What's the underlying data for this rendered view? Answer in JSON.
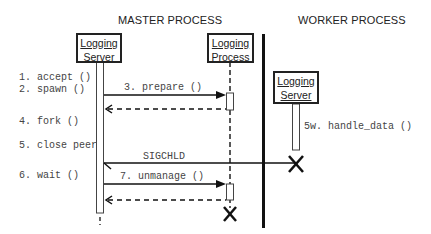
{
  "headers": {
    "master": "MASTER PROCESS",
    "worker": "WORKER PROCESS"
  },
  "objects": {
    "master_server": {
      "line1": "Logging",
      "line2": "Server"
    },
    "master_process": {
      "line1": "Logging",
      "line2": "Process"
    },
    "worker_server": {
      "line1": "Logging",
      "line2": "Server"
    }
  },
  "steps": [
    "1. accept ()",
    "2. spawn ()",
    "4. fork ()",
    "5. close peer",
    "6. wait ()"
  ],
  "messages": {
    "prepare": "3. prepare ()",
    "sigchld": "SIGCHLD",
    "unmanage": "7. unmanage ()",
    "handle_data": "5w. handle_data ()"
  }
}
